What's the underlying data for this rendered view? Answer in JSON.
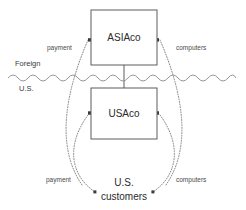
{
  "diagram": {
    "entities": [
      {
        "id": "asiaco",
        "label": "ASIAco",
        "region": "Foreign"
      },
      {
        "id": "usaco",
        "label": "USAco",
        "region": "U.S."
      }
    ],
    "actors": [
      {
        "id": "us-customers",
        "label_line1": "U.S.",
        "label_line2": "customers"
      }
    ],
    "border": {
      "label_above": "Foreign",
      "label_below": "U.S.",
      "style": "wavy-line"
    },
    "flows": [
      {
        "id": "payment-to-asiaco",
        "label": "payment",
        "style": "dotted-arc",
        "direction": "to-asiaco"
      },
      {
        "id": "computers-from-asiaco",
        "label": "computers",
        "style": "dotted-arc",
        "direction": "from-asiaco"
      },
      {
        "id": "payment-to-usaco",
        "label": "payment",
        "style": "dotted-arc",
        "direction": "to-usaco"
      },
      {
        "id": "computers-from-usaco",
        "label": "computers",
        "style": "dotted-arc",
        "direction": "from-usaco"
      }
    ],
    "colors": {
      "background": "#ffffff",
      "box_stroke": "#5d5d5d",
      "text": "#2b2b2b",
      "flow_stroke": "#7a7a7a",
      "border_stroke": "#8a8a8a"
    }
  }
}
